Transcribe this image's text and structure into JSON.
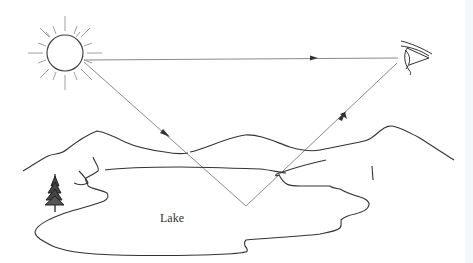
{
  "diagram": {
    "type": "illustration",
    "labels": {
      "lake": "Lake"
    },
    "elements": [
      {
        "id": "sun",
        "icon": "sun-icon"
      },
      {
        "id": "eye",
        "icon": "eye-icon"
      },
      {
        "id": "tree",
        "icon": "tree-icon"
      },
      {
        "id": "mountains"
      },
      {
        "id": "lake"
      }
    ],
    "rays": [
      {
        "id": "direct-ray",
        "from": "sun",
        "to": "eye",
        "description": "direct sunlight"
      },
      {
        "id": "incident-ray",
        "from": "sun",
        "to": "lake-surface",
        "description": "incident sunlight toward lake"
      },
      {
        "id": "reflected-ray",
        "from": "lake-surface",
        "to": "eye",
        "description": "light reflected off lake surface"
      }
    ],
    "colors": {
      "line": "#333333",
      "ray": "#8a8a8a",
      "background": "#ffffff"
    }
  }
}
